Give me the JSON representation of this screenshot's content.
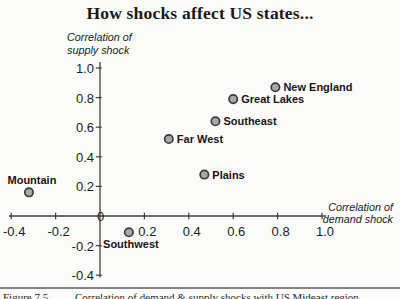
{
  "chart_data": {
    "type": "scatter",
    "title": "How shocks affect US states...",
    "xlabel": "Correlation of\ndemand shock",
    "ylabel": "Correlation of\nsupply shock",
    "xlim": [
      -0.4,
      1.0
    ],
    "ylim": [
      -0.4,
      1.0
    ],
    "xticks": [
      -0.4,
      -0.2,
      0.2,
      0.4,
      0.6,
      0.8,
      1.0
    ],
    "yticks": [
      -0.4,
      -0.2,
      0.2,
      0.4,
      0.6,
      0.8,
      1.0
    ],
    "origin_label": "0",
    "grid": false,
    "legend": false,
    "marker_fill": "#a8a8a8",
    "marker_stroke": "#3c3c3c",
    "points": [
      {
        "label": "New England",
        "x": 0.79,
        "y": 0.87,
        "label_pos": "right"
      },
      {
        "label": "Great Lakes",
        "x": 0.6,
        "y": 0.79,
        "label_pos": "right"
      },
      {
        "label": "Southeast",
        "x": 0.52,
        "y": 0.64,
        "label_pos": "right"
      },
      {
        "label": "Far West",
        "x": 0.31,
        "y": 0.52,
        "label_pos": "right"
      },
      {
        "label": "Plains",
        "x": 0.47,
        "y": 0.28,
        "label_pos": "right"
      },
      {
        "label": "Mountain",
        "x": -0.32,
        "y": 0.16,
        "label_pos": "above"
      },
      {
        "label": "Southwest",
        "x": 0.13,
        "y": -0.11,
        "label_pos": "below"
      }
    ]
  },
  "footer": {
    "figure_label": "Figure 7.5",
    "caption": "Correlation of demand & supply shocks with US Mideast region"
  }
}
